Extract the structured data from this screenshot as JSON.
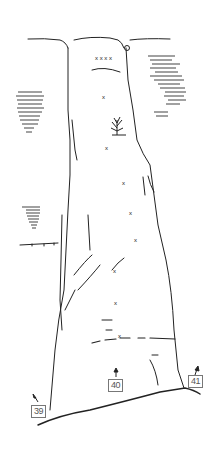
{
  "diagram": {
    "type": "climbing-topo",
    "ink_color": "#222222",
    "route_labels": [
      {
        "id": "route-39",
        "label": "39",
        "x": 32,
        "y": 405
      },
      {
        "id": "route-40",
        "label": "40",
        "x": 108,
        "y": 380
      },
      {
        "id": "route-41",
        "label": "41",
        "x": 188,
        "y": 376
      }
    ],
    "features": [
      "summit rim with notches",
      "tree on ledge",
      "bolt markers (x) along central line",
      "horizontal hatched rock masses on left and right",
      "ground line at base"
    ]
  }
}
